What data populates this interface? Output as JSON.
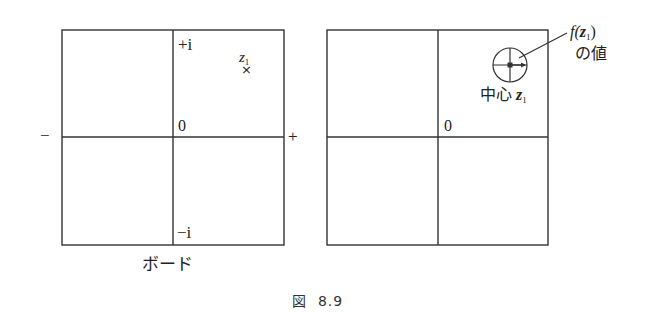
{
  "figure": {
    "caption_prefix": "図",
    "caption_number": "8.9"
  },
  "left_panel": {
    "title": "ボード",
    "axis_labels": {
      "plus_i": "+i",
      "minus_i": "−i",
      "origin": "0",
      "neg_real": "−",
      "pos_real": "+"
    },
    "point": {
      "name": "z",
      "subscript": "1",
      "marker": "×"
    }
  },
  "right_panel": {
    "axis_labels": {
      "origin": "0"
    },
    "annotation": {
      "func": "f(",
      "var": "z",
      "subscript": "1",
      "close": ")",
      "line2": "の値"
    },
    "center_label": {
      "text": "中心",
      "var": "z",
      "subscript": "1"
    }
  },
  "colors": {
    "line": "#333333",
    "background": "#ffffff"
  }
}
